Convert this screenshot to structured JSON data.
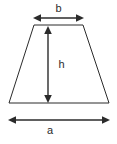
{
  "diagram": {
    "type": "geometry-figure",
    "shape": "trapezoid",
    "canvas": {
      "width": 117,
      "height": 144,
      "background": "#ffffff"
    },
    "stroke_color": "#2b2b2b",
    "labels": {
      "top_width": "b",
      "height": "h",
      "bottom_width": "a"
    },
    "dimensions": {
      "top_edge": {
        "x1": 34,
        "x2": 83,
        "y": 25
      },
      "bottom_edge": {
        "x1": 9,
        "x2": 109,
        "y": 103
      },
      "b_arrow": {
        "x1": 34,
        "x2": 83,
        "y": 18
      },
      "h_arrow": {
        "x": 48,
        "y1": 27,
        "y2": 102
      },
      "a_arrow": {
        "x1": 9,
        "x2": 109,
        "y": 120
      }
    }
  }
}
